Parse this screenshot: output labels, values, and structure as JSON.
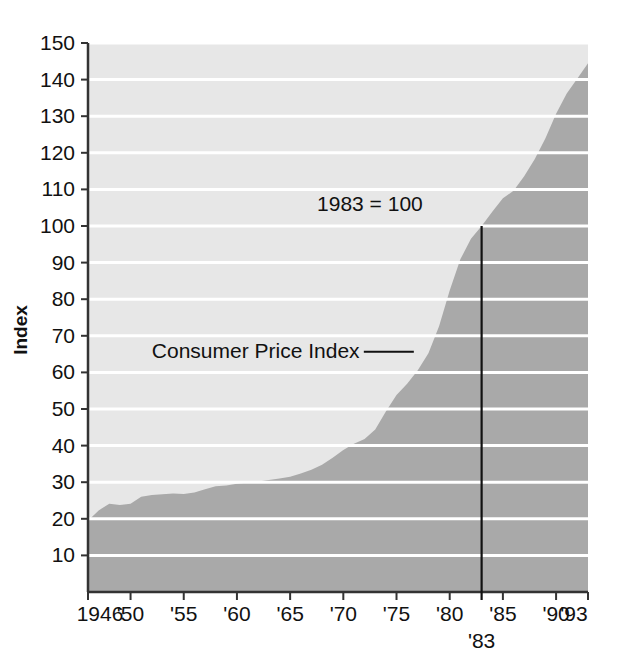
{
  "chart_data": {
    "type": "area",
    "title": "",
    "subtitle": "",
    "xlabel": "",
    "ylabel": "Index",
    "xlim": [
      1946,
      1993
    ],
    "ylim": [
      0,
      150
    ],
    "grid": true,
    "grid_color": "#ffffff",
    "legend": "none",
    "series": [
      {
        "name": "Consumer Price Index",
        "fill_color": "#a9a9a9",
        "x": [
          1946,
          1947,
          1948,
          1949,
          1950,
          1951,
          1952,
          1953,
          1954,
          1955,
          1956,
          1957,
          1958,
          1959,
          1960,
          1961,
          1962,
          1963,
          1964,
          1965,
          1966,
          1967,
          1968,
          1969,
          1970,
          1971,
          1972,
          1973,
          1974,
          1975,
          1976,
          1977,
          1978,
          1979,
          1980,
          1981,
          1982,
          1983,
          1984,
          1985,
          1986,
          1987,
          1988,
          1989,
          1990,
          1991,
          1992,
          1993
        ],
        "values": [
          19.5,
          22.3,
          24.1,
          23.8,
          24.1,
          26.0,
          26.5,
          26.7,
          26.9,
          26.8,
          27.2,
          28.1,
          28.9,
          29.1,
          29.6,
          29.9,
          30.2,
          30.6,
          31.0,
          31.5,
          32.4,
          33.4,
          34.8,
          36.7,
          38.8,
          40.5,
          41.8,
          44.4,
          49.3,
          53.8,
          56.9,
          60.6,
          65.2,
          72.6,
          82.4,
          90.9,
          96.5,
          100.0,
          103.9,
          107.6,
          109.6,
          113.6,
          118.3,
          124.0,
          130.7,
          136.2,
          140.3,
          144.5
        ]
      }
    ],
    "yticks": [
      10,
      20,
      30,
      40,
      50,
      60,
      70,
      80,
      90,
      100,
      110,
      120,
      130,
      140,
      150
    ],
    "ytick_labels": [
      "10",
      "20",
      "30",
      "40",
      "50",
      "60",
      "70",
      "80",
      "90",
      "100",
      "110",
      "120",
      "130",
      "140",
      "150"
    ],
    "xticks": [
      1946,
      1950,
      1955,
      1960,
      1965,
      1970,
      1975,
      1980,
      1985,
      1990,
      1993
    ],
    "xtick_labels": [
      "1946",
      "'50",
      "'55",
      "'60",
      "'65",
      "'70",
      "'75",
      "'80",
      "'85",
      "'90",
      "'93"
    ],
    "annotations": [
      {
        "name": "base-year-note",
        "text": "1983 = 100",
        "x": 1972.5,
        "y": 104
      },
      {
        "name": "series-callout",
        "text": "Consumer Price Index",
        "x": 1952.0,
        "y": 64
      }
    ],
    "reference_line": {
      "name": "1983-reference-line",
      "label": "'83",
      "x": 1983,
      "y_top": 100,
      "y_bottom": 0,
      "color": "#111111"
    },
    "background_color": "#e7e7e7",
    "axis_color": "#333333"
  },
  "axis": {
    "y_title": "Index"
  }
}
